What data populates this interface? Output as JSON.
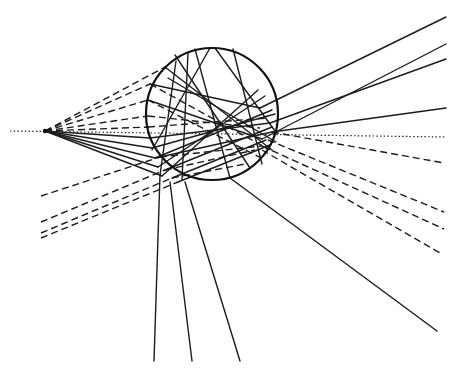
{
  "diagram": {
    "colors": {
      "ink": "#1c1c1c",
      "background": "#ffffff"
    },
    "sphere": {
      "cx": 212,
      "cy": 114,
      "r": 66
    },
    "source": {
      "x": 45,
      "y": 131
    },
    "axis": {
      "x1": 10,
      "y1": 131,
      "x2": 446,
      "y2": 137,
      "style": "dotted"
    },
    "incident_dashed": [
      [
        45,
        131,
        165,
        67
      ],
      [
        45,
        131,
        150,
        84
      ],
      [
        45,
        131,
        148,
        100
      ],
      [
        45,
        131,
        148,
        116
      ],
      [
        45,
        131,
        149,
        127
      ]
    ],
    "incident_solid": [
      [
        45,
        131,
        150,
        138
      ],
      [
        45,
        131,
        152,
        148
      ],
      [
        45,
        131,
        155,
        158
      ],
      [
        45,
        131,
        158,
        167
      ],
      [
        45,
        131,
        162,
        176
      ]
    ],
    "left_dashed": [
      [
        41,
        196,
        160,
        157
      ],
      [
        41,
        222,
        165,
        170
      ],
      [
        41,
        233,
        172,
        178
      ],
      [
        41,
        238,
        178,
        182
      ]
    ],
    "internal_solid": [
      [
        165,
        67,
        272,
        150
      ],
      [
        150,
        84,
        260,
        108
      ],
      [
        148,
        100,
        262,
        139
      ],
      [
        175,
        55,
        250,
        168
      ],
      [
        195,
        49,
        230,
        178
      ],
      [
        215,
        48,
        275,
        131
      ],
      [
        233,
        49,
        262,
        164
      ],
      [
        150,
        138,
        270,
        123
      ],
      [
        152,
        148,
        275,
        114
      ],
      [
        155,
        158,
        272,
        110
      ],
      [
        158,
        167,
        265,
        96
      ],
      [
        162,
        176,
        258,
        90
      ],
      [
        176,
        61,
        160,
        175
      ],
      [
        168,
        78,
        276,
        142
      ],
      [
        210,
        48,
        152,
        150
      ],
      [
        188,
        53,
        182,
        180
      ],
      [
        160,
        157,
        272,
        132
      ],
      [
        165,
        170,
        272,
        127
      ],
      [
        172,
        178,
        266,
        140
      ],
      [
        178,
        182,
        270,
        145
      ]
    ],
    "internal_dashed": [
      [
        150,
        84,
        270,
        150
      ],
      [
        148,
        100,
        265,
        160
      ],
      [
        148,
        116,
        260,
        128
      ],
      [
        148,
        127,
        268,
        118
      ],
      [
        160,
        157,
        262,
        146
      ],
      [
        165,
        170,
        255,
        150
      ],
      [
        172,
        178,
        245,
        164
      ]
    ],
    "exit_solid": [
      [
        260,
        108,
        446,
        17
      ],
      [
        262,
        139,
        446,
        44
      ],
      [
        270,
        123,
        446,
        59
      ],
      [
        272,
        132,
        446,
        108
      ],
      [
        160,
        175,
        154,
        361
      ],
      [
        170,
        182,
        192,
        361
      ],
      [
        185,
        182,
        240,
        361
      ],
      [
        230,
        178,
        437,
        331
      ]
    ],
    "exit_dashed": [
      [
        272,
        132,
        444,
        163
      ],
      [
        268,
        140,
        444,
        212
      ],
      [
        262,
        146,
        444,
        229
      ],
      [
        262,
        150,
        440,
        253
      ]
    ]
  }
}
